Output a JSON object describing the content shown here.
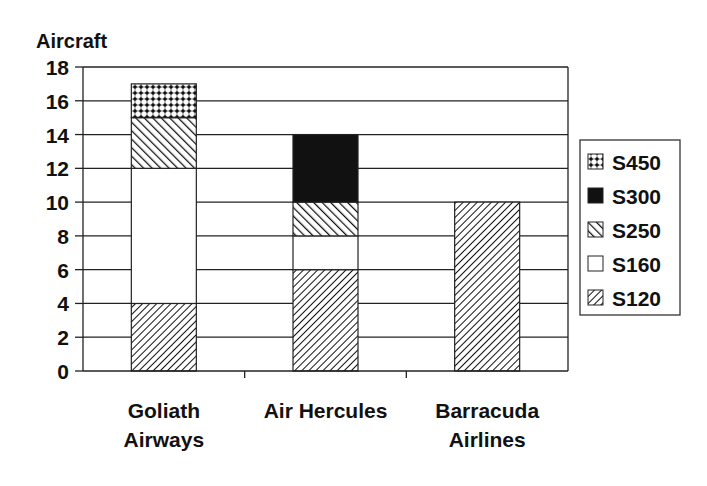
{
  "chart_data": {
    "type": "bar",
    "stacked": true,
    "title": "",
    "ylabel": "Aircraft",
    "xlabel": "",
    "ylim": [
      0,
      18
    ],
    "yticks": [
      0,
      2,
      4,
      6,
      8,
      10,
      12,
      14,
      16,
      18
    ],
    "grid": true,
    "legend_position": "right",
    "categories": [
      [
        "Goliath",
        "Airways"
      ],
      [
        "Air Hercules"
      ],
      [
        "Barracuda",
        "Airlines"
      ]
    ],
    "series": [
      {
        "name": "S120",
        "pattern": "diag-fine",
        "values": [
          4,
          6,
          10
        ]
      },
      {
        "name": "S160",
        "pattern": "white",
        "values": [
          8,
          2,
          0
        ]
      },
      {
        "name": "S250",
        "pattern": "diag-back",
        "values": [
          3,
          2,
          0
        ]
      },
      {
        "name": "S300",
        "pattern": "solid",
        "values": [
          0,
          4,
          0
        ]
      },
      {
        "name": "S450",
        "pattern": "dots",
        "values": [
          2,
          0,
          0
        ]
      }
    ],
    "legend_order": [
      "S450",
      "S300",
      "S250",
      "S160",
      "S120"
    ]
  }
}
